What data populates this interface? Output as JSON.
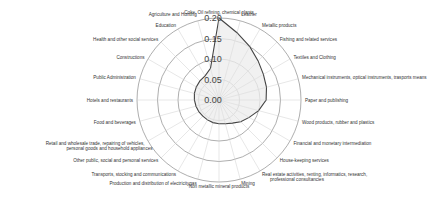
{
  "chart_data": {
    "type": "radar",
    "title": "",
    "center": [
      219,
      100
    ],
    "max_radius": 82,
    "rlim": [
      0,
      0.2
    ],
    "r_ticks": [
      "0.00",
      "0.05",
      "0.10",
      "0.15",
      "0.20"
    ],
    "r_tick_values": [
      0.0,
      0.05,
      0.1,
      0.15,
      0.2
    ],
    "categories": [
      "Coke, Oil refining, chemical plants",
      "Leather",
      "Metallic products",
      "Fishing and related services",
      "Textiles and Clothing",
      "Mechanical instruments, optical instruments, trasports means",
      "Paper and publishing",
      "Wood products, rubber and plastics",
      "Financial and monetary intermediation",
      "House-keeping services",
      "Real estate activities, renting, informatics, research, professional consultancies",
      "Mining",
      "Non metallic mineral products",
      "Production and distribution of electricitygas",
      "Transports, stocking and communications",
      "Other public, social and personal services",
      "Retail and wholesale trade, repairing of vehicles, personal goods and household appliances",
      "Food and beverages",
      "Hotels and restaurants",
      "Public Administration",
      "Constructions",
      "Health and other social services",
      "Education",
      "Agriculture and Hunting"
    ],
    "series": [
      {
        "name": "value",
        "values": [
          0.2,
          0.17,
          0.15,
          0.135,
          0.125,
          0.12,
          0.115,
          0.1,
          0.085,
          0.075,
          0.065,
          0.06,
          0.058,
          0.057,
          0.056,
          0.056,
          0.057,
          0.058,
          0.06,
          0.062,
          0.064,
          0.066,
          0.068,
          0.08
        ],
        "fill": "#ececec",
        "stroke": "#444444"
      }
    ],
    "grid": true,
    "legend": "none"
  }
}
